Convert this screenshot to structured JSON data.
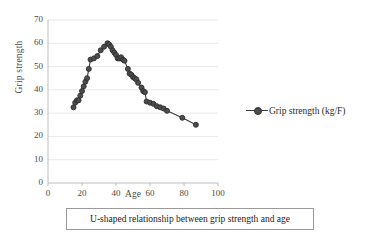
{
  "chart_data": {
    "type": "line",
    "title": "",
    "xlabel": "Age",
    "ylabel": "Grip strength",
    "xlim": [
      0,
      100
    ],
    "ylim": [
      0,
      70
    ],
    "xticks": [
      "0",
      "20",
      "40",
      "60",
      "80",
      "100"
    ],
    "yticks": [
      "0",
      "10",
      "20",
      "30",
      "40",
      "50",
      "60",
      "70"
    ],
    "grid": "horizontal",
    "legend_position": "right",
    "marker": "circle",
    "series": [
      {
        "name": "Grip strength (kg/F)",
        "color": "#4d4d4d",
        "x": [
          15,
          16,
          17,
          18,
          19,
          20,
          21,
          22,
          23,
          24,
          25,
          27,
          29,
          31,
          33,
          35,
          36,
          37,
          38,
          39,
          40,
          41,
          42,
          43,
          44,
          45,
          47,
          48,
          49,
          50,
          51,
          52,
          53,
          55,
          56,
          57,
          58,
          60,
          62,
          64,
          66,
          68,
          70,
          79,
          87
        ],
        "y": [
          32.5,
          34.5,
          35.5,
          35.5,
          37.5,
          39.5,
          41.5,
          43.5,
          45,
          49,
          53,
          53.5,
          54.5,
          57,
          58.5,
          60,
          59.5,
          58.5,
          57,
          56,
          55,
          53.5,
          53.5,
          54,
          53,
          52.5,
          49,
          47,
          46.5,
          45.5,
          45,
          44.5,
          43,
          41,
          39.5,
          39,
          35,
          34.5,
          34,
          33,
          32.5,
          32,
          31,
          28,
          25
        ]
      }
    ]
  },
  "axis_titles": {
    "x": "Age",
    "y": "Grip strength"
  },
  "legend": {
    "entry_label": "Grip strength (kg/F)",
    "marker_name": "line-with-circle-marker"
  },
  "caption": {
    "text": "U-shaped relationship between grip strength and age"
  },
  "colors": {
    "marker_fill": "#4d4d4d",
    "marker_stroke": "#2e2e2e",
    "line": "#3a3a3a",
    "gridline": "#e9e9e9",
    "axis": "#bdbdbd",
    "text": "#2b2b2b",
    "caption_border": "#9a9a9a"
  }
}
